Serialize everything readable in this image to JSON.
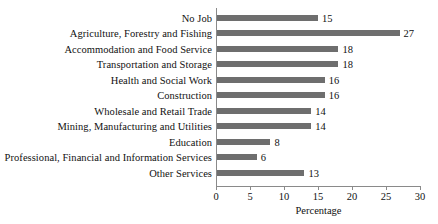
{
  "chart_data": {
    "type": "bar",
    "orientation": "horizontal",
    "title": "",
    "xlabel": "Percentage",
    "ylabel": "",
    "xlim": [
      0,
      30
    ],
    "xticks": [
      0,
      5,
      10,
      15,
      20,
      25,
      30
    ],
    "grid": false,
    "legend": null,
    "bar_color": "#6e6e6e",
    "axis_color": "#8a8a8a",
    "text_color": "#111111",
    "categories": [
      "No Job",
      "Agriculture, Forestry and Fishing",
      "Accommodation and Food Service",
      "Transportation and Storage",
      "Health and Social Work",
      "Construction",
      "Wholesale and Retail Trade",
      "Mining, Manufacturing and Utilities",
      "Education",
      "Professional, Financial and Information Services",
      "Other Services"
    ],
    "values": [
      15,
      27,
      18,
      18,
      16,
      16,
      14,
      14,
      8,
      6,
      13
    ],
    "value_labels": [
      "15",
      "27",
      "18",
      "18",
      "16",
      "16",
      "14",
      "14",
      "8",
      "6",
      "13"
    ],
    "xtick_labels": [
      "0",
      "5",
      "10",
      "15",
      "20",
      "25",
      "30"
    ]
  }
}
